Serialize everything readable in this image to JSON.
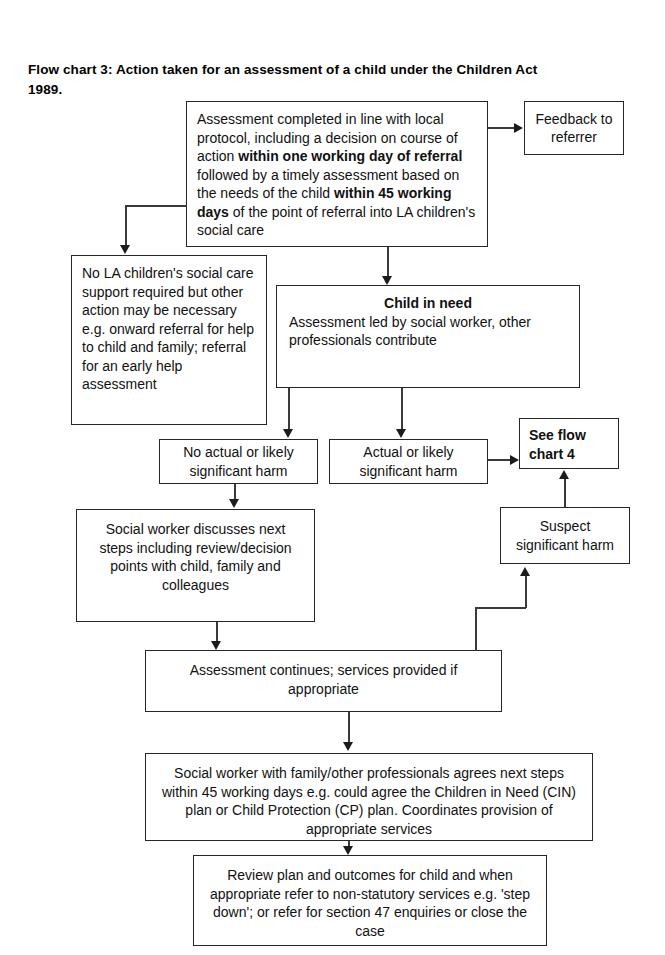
{
  "document": {
    "title_line1": "Flow chart 3: Action taken for an assessment of a child under the Children Act",
    "title_line2": "1989."
  },
  "diagram_data": {
    "type": "flowchart",
    "title": "Flow chart 3: Action taken for an assessment of a child under the Children Act 1989.",
    "orientation": "top-to-bottom",
    "nodes": [
      {
        "id": "assessment-completed",
        "shape": "rectangle",
        "text": "Assessment completed in line with local protocol, including a decision on course of action within one working day of referral followed by a timely assessment based on the needs of the child within 45 working days of the point of referral into LA children's social care",
        "bold_phrases": [
          "within one working day of referral",
          "within 45 working days"
        ]
      },
      {
        "id": "feedback-to-referrer",
        "shape": "rectangle",
        "text": "Feedback to referrer"
      },
      {
        "id": "no-la-support",
        "shape": "rectangle",
        "text": "No LA children's social care support required but other action may be necessary e.g. onward referral for help to child and family; referral for an early help assessment"
      },
      {
        "id": "child-in-need",
        "shape": "rectangle",
        "heading": "Child in need",
        "text": "Assessment led by social worker, other professionals contribute"
      },
      {
        "id": "no-actual-harm",
        "shape": "rectangle",
        "text": "No actual or likely significant harm"
      },
      {
        "id": "actual-harm",
        "shape": "rectangle",
        "text": "Actual or likely significant harm"
      },
      {
        "id": "see-flow-chart-4",
        "shape": "rectangle",
        "text": "See flow chart 4",
        "bold": true
      },
      {
        "id": "suspect-harm",
        "shape": "rectangle",
        "text": "Suspect significant harm"
      },
      {
        "id": "sw-discusses",
        "shape": "rectangle",
        "text": "Social worker discusses next steps including review/decision points with child, family and colleagues"
      },
      {
        "id": "assessment-continues",
        "shape": "rectangle",
        "text": "Assessment continues; services provided if appropriate"
      },
      {
        "id": "sw-agrees-next-steps",
        "shape": "rectangle",
        "text": "Social worker with family/other professionals agrees next steps within 45 working days e.g. could agree the Children in Need (CIN) plan or Child Protection (CP) plan. Coordinates provision of appropriate services"
      },
      {
        "id": "review-plan",
        "shape": "rectangle",
        "text": "Review plan and outcomes for child and when appropriate refer to non-statutory services e.g. 'step down'; or refer for section 47 enquiries or close the case"
      }
    ],
    "edges": [
      {
        "from": "assessment-completed",
        "to": "feedback-to-referrer",
        "direction": "right"
      },
      {
        "from": "assessment-completed",
        "to": "no-la-support",
        "direction": "down"
      },
      {
        "from": "assessment-completed",
        "to": "child-in-need",
        "direction": "down"
      },
      {
        "from": "child-in-need",
        "to": "no-actual-harm",
        "direction": "down"
      },
      {
        "from": "child-in-need",
        "to": "actual-harm",
        "direction": "down"
      },
      {
        "from": "actual-harm",
        "to": "see-flow-chart-4",
        "direction": "right"
      },
      {
        "from": "suspect-harm",
        "to": "see-flow-chart-4",
        "direction": "up"
      },
      {
        "from": "no-actual-harm",
        "to": "sw-discusses",
        "direction": "down"
      },
      {
        "from": "sw-discusses",
        "to": "assessment-continues",
        "direction": "down"
      },
      {
        "from": "assessment-continues",
        "to": "suspect-harm",
        "direction": "up"
      },
      {
        "from": "assessment-continues",
        "to": "sw-agrees-next-steps",
        "direction": "down"
      },
      {
        "from": "sw-agrees-next-steps",
        "to": "review-plan",
        "direction": "down"
      }
    ]
  },
  "boxes": {
    "assessment_completed": {
      "seg1": "Assessment completed in line with local protocol, including a decision on course of action ",
      "seg2_bold": "within one working day of referral",
      "seg3": " followed by a timely assessment based on the needs of the child ",
      "seg4_bold": "within 45 working days",
      "seg5": " of the point of referral into LA children's social care"
    },
    "feedback_to_referrer": "Feedback to referrer",
    "no_la_support": "No LA children's social care support required but other action may be necessary e.g. onward referral for help to child and family; referral for an early help assessment",
    "child_in_need_heading": "Child in need",
    "child_in_need_body": "Assessment led by social worker, other professionals contribute",
    "no_actual_harm": "No actual or likely significant harm",
    "actual_harm": "Actual or likely significant harm",
    "see_flow_chart_4": "See flow chart 4",
    "suspect_harm": "Suspect significant harm",
    "sw_discusses": "Social worker discusses next steps including review/decision points with child, family and colleagues",
    "assessment_continues": "Assessment continues; services provided if appropriate",
    "sw_agrees_next_steps": "Social worker with family/other professionals agrees next steps within 45 working days e.g. could agree the Children in Need (CIN) plan or Child Protection (CP) plan. Coordinates provision of appropriate services",
    "review_plan": "Review plan and outcomes for child and when appropriate refer to non-statutory services e.g. 'step down'; or refer for section 47 enquiries or close the case"
  },
  "colors": {
    "background": "#ffffff",
    "box_border": "#262626",
    "connector": "#3a3a3a",
    "text": "#111111"
  }
}
